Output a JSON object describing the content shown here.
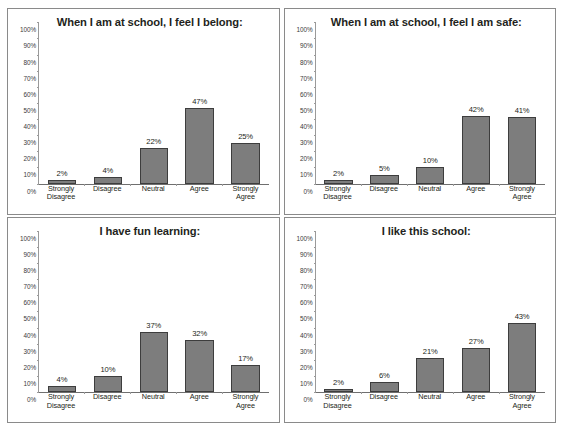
{
  "figure": {
    "name": "school-climate-survey-bar-charts",
    "layout": "2x2 grid of bar charts",
    "bar_color": "#7d7d7d",
    "bar_border_color": "#3d3d3d",
    "panel_border_color": "#8a8a8a",
    "background": "#ffffff"
  },
  "axis": {
    "yticks": [
      "100%",
      "90%",
      "80%",
      "70%",
      "60%",
      "50%",
      "40%",
      "30%",
      "20%",
      "10%",
      "0%"
    ],
    "categories": [
      [
        "Strongly",
        "Disagree"
      ],
      [
        "Disagree"
      ],
      [
        "Neutral"
      ],
      [
        "Agree"
      ],
      [
        "Strongly",
        "Agree"
      ]
    ]
  },
  "chart_data": [
    {
      "type": "bar",
      "title": "When I am at school, I feel I belong:",
      "categories": [
        "Strongly Disagree",
        "Disagree",
        "Neutral",
        "Agree",
        "Strongly Agree"
      ],
      "values": [
        2,
        4,
        22,
        47,
        25
      ],
      "labels": [
        "2%",
        "4%",
        "22%",
        "47%",
        "25%"
      ],
      "xlabel": "",
      "ylabel": "",
      "ylim": [
        0,
        100
      ],
      "grid": false,
      "legend": "none"
    },
    {
      "type": "bar",
      "title": "When I am at school, I feel I am safe:",
      "categories": [
        "Strongly Disagree",
        "Disagree",
        "Neutral",
        "Agree",
        "Strongly Agree"
      ],
      "values": [
        2,
        5,
        10,
        42,
        41
      ],
      "labels": [
        "2%",
        "5%",
        "10%",
        "42%",
        "41%"
      ],
      "xlabel": "",
      "ylabel": "",
      "ylim": [
        0,
        100
      ],
      "grid": false,
      "legend": "none"
    },
    {
      "type": "bar",
      "title": "I have fun learning:",
      "categories": [
        "Strongly Disagree",
        "Disagree",
        "Neutral",
        "Agree",
        "Strongly Agree"
      ],
      "values": [
        4,
        10,
        37,
        32,
        17
      ],
      "labels": [
        "4%",
        "10%",
        "37%",
        "32%",
        "17%"
      ],
      "xlabel": "",
      "ylabel": "",
      "ylim": [
        0,
        100
      ],
      "grid": false,
      "legend": "none"
    },
    {
      "type": "bar",
      "title": "I like this school:",
      "categories": [
        "Strongly Disagree",
        "Disagree",
        "Neutral",
        "Agree",
        "Strongly Agree"
      ],
      "values": [
        2,
        6,
        21,
        27,
        43
      ],
      "labels": [
        "2%",
        "6%",
        "21%",
        "27%",
        "43%"
      ],
      "xlabel": "",
      "ylabel": "",
      "ylim": [
        0,
        100
      ],
      "grid": false,
      "legend": "none"
    }
  ]
}
